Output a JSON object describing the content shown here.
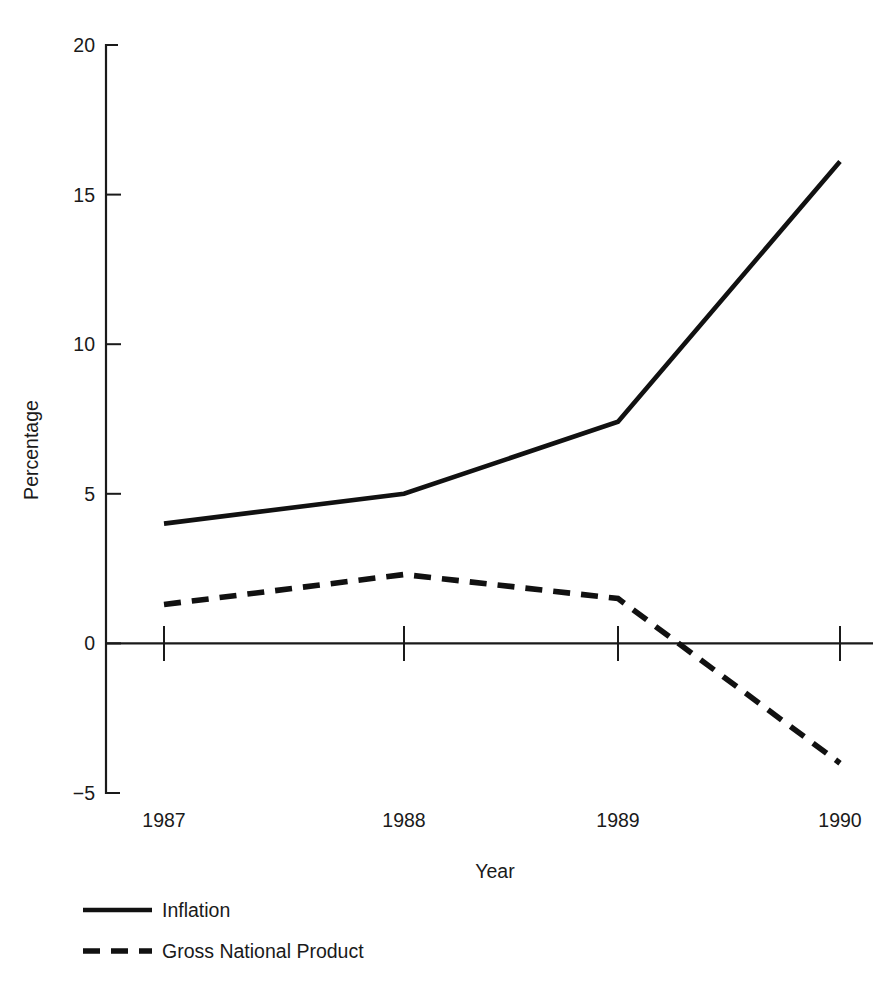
{
  "chart_data": {
    "type": "line",
    "title": "",
    "subtitle": "",
    "xlabel": "Year",
    "ylabel": "Percentage",
    "x": [
      "1987",
      "1988",
      "1989",
      "1990"
    ],
    "categories": [
      "1987",
      "1988",
      "1989",
      "1990"
    ],
    "xtick_labels": [
      "1987",
      "1988",
      "1989",
      "1990"
    ],
    "ytick_labels": [
      "20",
      "15",
      "10",
      "5",
      "0",
      "−5"
    ],
    "ytick_values": [
      20,
      15,
      10,
      5,
      0,
      -5
    ],
    "ylim": [
      -5,
      20
    ],
    "grid": false,
    "legend_position": "below-axes-left",
    "zero_line": true,
    "series": [
      {
        "name": "Inflation",
        "style": "solid",
        "color": "#111111",
        "values": [
          4.0,
          5.0,
          7.4,
          16.1
        ]
      },
      {
        "name": "Gross National Product",
        "style": "dashed",
        "color": "#111111",
        "values": [
          1.3,
          2.3,
          1.5,
          -4.0
        ]
      }
    ],
    "annotations": []
  },
  "axes": {
    "y_label": "Percentage",
    "x_label": "Year",
    "y_ticks": [
      {
        "label": "20",
        "value": 20
      },
      {
        "label": "15",
        "value": 15
      },
      {
        "label": "10",
        "value": 10
      },
      {
        "label": "5",
        "value": 5
      },
      {
        "label": "0",
        "value": 0
      },
      {
        "label": "−5",
        "value": -5
      }
    ],
    "x_ticks": [
      {
        "label": "1987"
      },
      {
        "label": "1988"
      },
      {
        "label": "1989"
      },
      {
        "label": "1990"
      }
    ]
  },
  "legend": {
    "entries": [
      {
        "label": "Inflation",
        "style": "solid"
      },
      {
        "label": "Gross National Product",
        "style": "dashed"
      }
    ]
  },
  "colors": {
    "background": "#ffffff",
    "ink": "#1a1a1a",
    "series": "#111111"
  }
}
